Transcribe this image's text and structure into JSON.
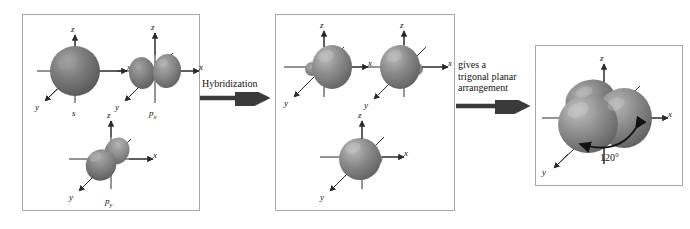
{
  "figure": {
    "panels": [
      {
        "id": "atomic-orbitals",
        "name": "atomic-orbital-panel",
        "orbitals": [
          {
            "id": "s",
            "label": "s",
            "label_sub": "",
            "type": "sphere"
          },
          {
            "id": "px",
            "label": "p",
            "label_sub": "x",
            "type": "dumbbell-x"
          },
          {
            "id": "py",
            "label": "p",
            "label_sub": "y",
            "type": "dumbbell-y"
          }
        ]
      },
      {
        "id": "hybrid-orbitals",
        "name": "hybrid-orbital-panel",
        "orbitals": [
          {
            "id": "sp2-a",
            "label": "",
            "label_sub": "",
            "type": "hybrid-right"
          },
          {
            "id": "sp2-b",
            "label": "",
            "label_sub": "",
            "type": "hybrid-left"
          },
          {
            "id": "sp2-c",
            "label": "",
            "label_sub": "",
            "type": "hybrid-front"
          }
        ]
      },
      {
        "id": "trigonal-planar",
        "name": "trigonal-planar-panel",
        "orbitals": [
          {
            "id": "sp2-combined",
            "label": "",
            "label_sub": "",
            "type": "trilobe"
          }
        ],
        "angle_label": "120°"
      }
    ],
    "arrows": [
      {
        "id": "hybridization-arrow",
        "caption": "Hybridization"
      },
      {
        "id": "result-arrow",
        "caption": "gives a\ntrigonal planar\narrangement"
      }
    ],
    "axes": {
      "x": "x",
      "y": "y",
      "z": "z"
    },
    "colors": {
      "panel_border": "#a8a8a8",
      "background": "#ffffff",
      "orbital_dark": "#6e6e6e",
      "orbital_mid": "#8d8d8d",
      "orbital_light": "#c9c9c9",
      "axis": "#2b2b2b",
      "arrow": "#3a3a3a",
      "text": "#111111"
    }
  }
}
